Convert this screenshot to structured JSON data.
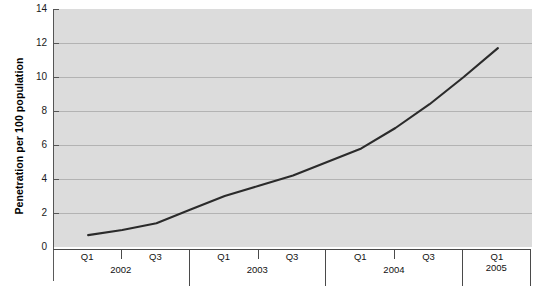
{
  "chart_data": {
    "type": "line",
    "title": "",
    "xlabel": "",
    "ylabel": "Penetration per 100 population",
    "ylim": [
      0,
      14
    ],
    "ytick_step": 2,
    "yticks": [
      14,
      12,
      10,
      8,
      6,
      4,
      2,
      0
    ],
    "grid": true,
    "legend": null,
    "line_color": "#2b2b2b",
    "plot_background": "#dcdcdc",
    "gridline_color": "#b3b3b3",
    "x": [
      "Q1 2002",
      "Q2 2002",
      "Q3 2002",
      "Q4 2002",
      "Q1 2003",
      "Q2 2003",
      "Q3 2003",
      "Q4 2003",
      "Q1 2004",
      "Q2 2004",
      "Q3 2004",
      "Q4 2004",
      "Q1 2005"
    ],
    "values": [
      0.7,
      1.0,
      1.4,
      2.2,
      3.0,
      3.6,
      4.2,
      5.0,
      5.8,
      7.0,
      8.4,
      10.0,
      11.7
    ],
    "xaxis_groups": [
      {
        "year": "2002",
        "quarters": [
          "Q1",
          "Q3"
        ]
      },
      {
        "year": "2003",
        "quarters": [
          "Q1",
          "Q3"
        ]
      },
      {
        "year": "2004",
        "quarters": [
          "Q1",
          "Q3"
        ]
      },
      {
        "year": "2005",
        "quarters": [
          "Q1"
        ]
      }
    ]
  },
  "axis": {
    "y_title": "Penetration per 100 population",
    "y_labels": [
      "14",
      "12",
      "10",
      "8",
      "6",
      "4",
      "2",
      "0"
    ],
    "x_years": [
      "2002",
      "2003",
      "2004",
      "2005"
    ],
    "x_quarters_q1": "Q1",
    "x_quarters_q3": "Q3"
  }
}
